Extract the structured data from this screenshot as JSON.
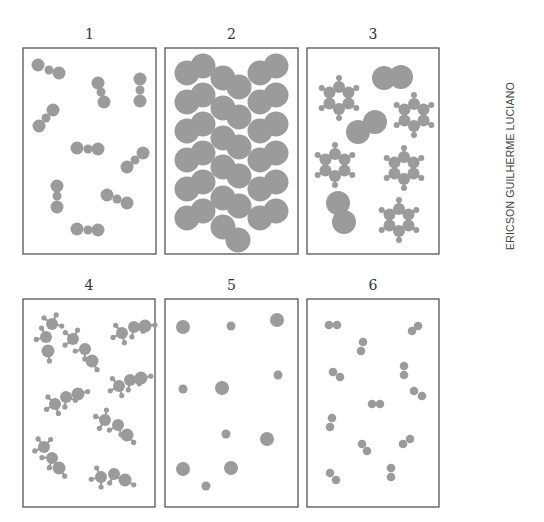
{
  "figure": {
    "atom_color": "#9b9b9b",
    "frame_color": "#555555",
    "credit": "ERICSON GUILHERME LUCIANO",
    "panels": [
      {
        "label": "1",
        "x": 23,
        "y": 48,
        "w": 133,
        "h": 206,
        "description": "triatomic linear molecules",
        "atoms": [
          [
            38,
            65,
            6.5
          ],
          [
            49,
            70,
            4.5
          ],
          [
            59,
            73,
            6.5
          ],
          [
            98,
            83,
            6.5
          ],
          [
            101,
            92,
            4.5
          ],
          [
            104,
            102,
            6.5
          ],
          [
            140,
            79,
            6.5
          ],
          [
            140,
            90,
            4.5
          ],
          [
            140,
            101,
            6.5
          ],
          [
            53,
            110,
            6.5
          ],
          [
            46,
            118,
            4.5
          ],
          [
            39,
            126,
            6.5
          ],
          [
            77,
            148,
            6.5
          ],
          [
            88,
            149,
            4.5
          ],
          [
            98,
            149,
            6.5
          ],
          [
            143,
            153,
            6.5
          ],
          [
            135,
            160,
            4.5
          ],
          [
            127,
            167,
            6.5
          ],
          [
            57,
            186,
            6.5
          ],
          [
            57,
            196,
            4.5
          ],
          [
            57,
            207,
            6.5
          ],
          [
            107,
            195,
            6.5
          ],
          [
            117,
            199,
            4.5
          ],
          [
            127,
            203,
            6.5
          ],
          [
            77,
            229,
            6.5
          ],
          [
            88,
            230,
            4.5
          ],
          [
            98,
            230,
            6.5
          ]
        ]
      },
      {
        "label": "2",
        "x": 165,
        "y": 48,
        "w": 133,
        "h": 206,
        "description": "densely packed diatomic molecules",
        "atoms": [
          [
            203,
            66,
            12.5
          ],
          [
            187,
            73,
            12.5
          ],
          [
            203,
            95,
            12.5
          ],
          [
            187,
            102,
            12.5
          ],
          [
            203,
            124,
            12.5
          ],
          [
            187,
            131,
            12.5
          ],
          [
            203,
            153,
            12.5
          ],
          [
            187,
            160,
            12.5
          ],
          [
            203,
            182,
            12.5
          ],
          [
            187,
            189,
            12.5
          ],
          [
            203,
            211,
            12.5
          ],
          [
            187,
            218,
            12.5
          ],
          [
            223,
            78,
            12.5
          ],
          [
            239,
            87,
            12.5
          ],
          [
            223,
            108,
            12.5
          ],
          [
            239,
            117,
            12.5
          ],
          [
            223,
            138,
            12.5
          ],
          [
            239,
            147,
            12.5
          ],
          [
            223,
            167,
            12.5
          ],
          [
            239,
            176,
            12.5
          ],
          [
            223,
            198,
            12.5
          ],
          [
            239,
            206,
            12.5
          ],
          [
            223,
            227,
            12.5
          ],
          [
            238,
            240,
            12.5
          ],
          [
            276,
            66,
            12.5
          ],
          [
            260,
            73,
            12.5
          ],
          [
            276,
            95,
            12.5
          ],
          [
            260,
            102,
            12.5
          ],
          [
            276,
            124,
            12.5
          ],
          [
            260,
            131,
            12.5
          ],
          [
            276,
            153,
            12.5
          ],
          [
            260,
            160,
            12.5
          ],
          [
            276,
            182,
            12.5
          ],
          [
            260,
            189,
            12.5
          ],
          [
            276,
            211,
            12.5
          ],
          [
            260,
            218,
            12.5
          ]
        ]
      },
      {
        "label": "3",
        "x": 307,
        "y": 48,
        "w": 132,
        "h": 206,
        "description": "benzene-like rings mixed with large diatomic molecules",
        "rings": [
          {
            "cx": 339,
            "cy": 98
          },
          {
            "cx": 414,
            "cy": 115
          },
          {
            "cx": 335,
            "cy": 165
          },
          {
            "cx": 404,
            "cy": 168
          },
          {
            "cx": 399,
            "cy": 220
          }
        ],
        "atoms": [
          [
            384,
            78,
            12
          ],
          [
            401,
            77,
            12
          ],
          [
            358,
            132,
            12
          ],
          [
            375,
            122,
            12
          ],
          [
            338,
            203,
            12
          ],
          [
            344,
            222,
            12
          ]
        ]
      },
      {
        "label": "4",
        "x": 23,
        "y": 299,
        "w": 132,
        "h": 208,
        "description": "ethanol-like molecules",
        "molecules": [
          [
            [
              52,
              324
            ],
            [
              46,
              337
            ],
            [
              48,
              351
            ]
          ],
          [
            [
              73,
              339
            ],
            [
              85,
              349
            ],
            [
              92,
              361
            ]
          ],
          [
            [
              122,
              333
            ],
            [
              134,
              327
            ],
            [
              145,
              326
            ]
          ],
          [
            [
              119,
              386
            ],
            [
              130,
              380
            ],
            [
              141,
              378
            ]
          ],
          [
            [
              55,
              404
            ],
            [
              66,
              397
            ],
            [
              78,
              394
            ]
          ],
          [
            [
              105,
              420
            ],
            [
              118,
              425
            ],
            [
              127,
              435
            ]
          ],
          [
            [
              44,
              447
            ],
            [
              52,
              458
            ],
            [
              59,
              468
            ]
          ],
          [
            [
              101,
              477
            ],
            [
              114,
              474
            ],
            [
              125,
              480
            ]
          ]
        ]
      },
      {
        "label": "5",
        "x": 165,
        "y": 299,
        "w": 133,
        "h": 208,
        "description": "monatomic particles of two sizes",
        "atoms": [
          [
            183,
            327,
            7
          ],
          [
            231,
            326,
            4.5
          ],
          [
            277,
            320,
            7
          ],
          [
            278,
            375,
            4.5
          ],
          [
            183,
            389,
            4.5
          ],
          [
            222,
            388,
            7
          ],
          [
            226,
            434,
            4.5
          ],
          [
            267,
            439,
            7
          ],
          [
            183,
            469,
            7
          ],
          [
            231,
            468,
            7
          ],
          [
            206,
            486,
            4.5
          ]
        ]
      },
      {
        "label": "6",
        "x": 307,
        "y": 299,
        "w": 132,
        "h": 208,
        "description": "small diatomic molecules",
        "atoms": [
          [
            329,
            325,
            4.3
          ],
          [
            337,
            325,
            4.3
          ],
          [
            412,
            331,
            4.3
          ],
          [
            418,
            326,
            4.3
          ],
          [
            363,
            342,
            4.3
          ],
          [
            361,
            351,
            4.3
          ],
          [
            333,
            372,
            4.3
          ],
          [
            340,
            377,
            4.3
          ],
          [
            404,
            366,
            4.3
          ],
          [
            404,
            375,
            4.3
          ],
          [
            414,
            391,
            4.3
          ],
          [
            422,
            396,
            4.3
          ],
          [
            372,
            404,
            4.3
          ],
          [
            380,
            404,
            4.3
          ],
          [
            332,
            418,
            4.3
          ],
          [
            330,
            427,
            4.3
          ],
          [
            362,
            444,
            4.3
          ],
          [
            367,
            451,
            4.3
          ],
          [
            403,
            444,
            4.3
          ],
          [
            410,
            439,
            4.3
          ],
          [
            330,
            473,
            4.3
          ],
          [
            336,
            480,
            4.3
          ],
          [
            391,
            468,
            4.3
          ],
          [
            391,
            477,
            4.3
          ]
        ]
      }
    ]
  }
}
